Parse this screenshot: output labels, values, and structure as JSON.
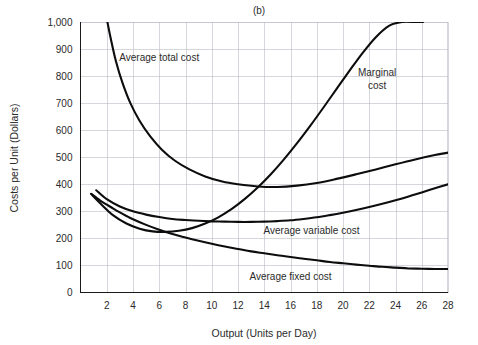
{
  "figure": {
    "panel_title": "(b)",
    "background_color": "#ffffff",
    "curve_color": "#0d0d0d",
    "grid_color": "#b9bdc4",
    "axis_color": "#1a1a1a"
  },
  "chart_data": {
    "type": "line",
    "title": "(b)",
    "xlabel": "Output (Units per Day)",
    "ylabel": "Costs per Unit (Dollars)",
    "xlim": [
      0,
      28
    ],
    "ylim": [
      0,
      1000
    ],
    "grid": true,
    "legend": "inline-labels",
    "xticks": [
      2,
      4,
      6,
      8,
      10,
      12,
      14,
      16,
      18,
      20,
      22,
      24,
      26,
      28
    ],
    "xtick_labels": [
      "2",
      "4",
      "6",
      "8",
      "10",
      "12",
      "14",
      "16",
      "18",
      "20",
      "22",
      "24",
      "26",
      "28"
    ],
    "yticks": [
      0,
      100,
      200,
      300,
      400,
      500,
      600,
      700,
      800,
      900,
      1000
    ],
    "ytick_labels": [
      "0",
      "100",
      "200",
      "300",
      "400",
      "500",
      "600",
      "700",
      "800",
      "900",
      "1,000"
    ],
    "series": [
      {
        "name": "Average total cost",
        "label": "Average total cost",
        "label_x": 6.0,
        "label_y": 855,
        "x": [
          2.05,
          2.3,
          2.7,
          3.2,
          3.8,
          4.5,
          5.3,
          6.2,
          7.2,
          8.3,
          9.5,
          10.8,
          12.0,
          13.5,
          15.0,
          16.5,
          18.0,
          19.5,
          21.0,
          22.5,
          24.0,
          25.5,
          27.0,
          28.0
        ],
        "y": [
          1000,
          940,
          855,
          775,
          700,
          635,
          578,
          528,
          487,
          455,
          429,
          410,
          400,
          392,
          390,
          395,
          405,
          420,
          437,
          455,
          474,
          492,
          508,
          517
        ]
      },
      {
        "name": "Marginal cost",
        "label": "Marginal cost",
        "label_x": 22.6,
        "label_y": 800,
        "label_line2": "cost",
        "x": [
          0.8,
          1.5,
          2.5,
          3.5,
          4.5,
          5.5,
          6.5,
          7.5,
          8.5,
          9.5,
          10.5,
          11.5,
          12.5,
          13.5,
          14.5,
          15.5,
          16.5,
          17.5,
          18.5,
          19.5,
          20.5,
          21.5,
          22.5,
          23.5,
          24.5,
          25.5,
          26.1
        ],
        "y": [
          365,
          330,
          285,
          255,
          236,
          226,
          224,
          228,
          238,
          255,
          278,
          308,
          345,
          388,
          437,
          492,
          552,
          616,
          683,
          752,
          820,
          886,
          944,
          986,
          1000,
          1000,
          1000
        ]
      },
      {
        "name": "Average variable cost",
        "label": "Average variable cost",
        "label_x": 17.6,
        "label_y": 215,
        "x": [
          1.2,
          2.0,
          3.0,
          4.0,
          5.0,
          6.0,
          7.0,
          8.0,
          9.0,
          10.0,
          11.0,
          12.0,
          13.0,
          14.0,
          15.0,
          16.0,
          17.0,
          18.0,
          19.0,
          20.0,
          21.0,
          22.0,
          23.0,
          24.0,
          25.0,
          26.0,
          27.0,
          28.0
        ],
        "y": [
          378,
          345,
          318,
          300,
          288,
          279,
          272,
          268,
          265,
          263,
          262,
          261,
          261,
          262,
          264,
          267,
          272,
          278,
          286,
          295,
          305,
          316,
          328,
          341,
          355,
          370,
          385,
          400
        ]
      },
      {
        "name": "Average fixed cost",
        "label": "Average fixed cost",
        "label_x": 16.0,
        "label_y": 48,
        "x": [
          0.85,
          1.5,
          2.0,
          2.5,
          3.0,
          3.5,
          4.0,
          5.0,
          6.0,
          7.0,
          8.0,
          9.0,
          10.0,
          11.0,
          12.0,
          13.0,
          14.0,
          15.0,
          16.0,
          17.0,
          18.0,
          19.0,
          20.0,
          21.0,
          22.0,
          23.0,
          24.0,
          25.0,
          26.0,
          27.0,
          28.0
        ],
        "y": [
          364,
          340,
          325,
          310,
          296,
          283,
          271,
          250,
          232,
          216,
          203,
          191,
          180,
          170,
          161,
          152,
          145,
          138,
          131,
          125,
          119,
          113,
          108,
          103,
          99,
          95,
          92,
          89,
          88,
          87,
          87
        ]
      }
    ]
  }
}
